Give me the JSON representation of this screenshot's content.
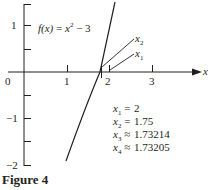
{
  "figure": {
    "caption": "Figure 4",
    "function_label": "f(x) = x² − 3",
    "function_label_parts": {
      "lhs": "f(x)",
      "eq": " = ",
      "x": "x",
      "exp": "2",
      "rest": " − 3"
    },
    "x_axis_label": "x",
    "x_ticks": [
      "0",
      "1",
      "2",
      "3"
    ],
    "y_ticks": [
      "1",
      "−1",
      "−2"
    ],
    "pointer_labels": [
      {
        "name": "x",
        "sub": "2"
      },
      {
        "name": "x",
        "sub": "1"
      }
    ],
    "iterates": [
      {
        "name": "x",
        "sub": "1",
        "rel": "=",
        "value": "2"
      },
      {
        "name": "x",
        "sub": "2",
        "rel": "=",
        "value": "1.75"
      },
      {
        "name": "x",
        "sub": "3",
        "rel": "≈",
        "value": "1.73214"
      },
      {
        "name": "x",
        "sub": "4",
        "rel": "≈",
        "value": "1.73205"
      }
    ],
    "colors": {
      "ink": "#231f20",
      "background": "#ffffff"
    }
  }
}
